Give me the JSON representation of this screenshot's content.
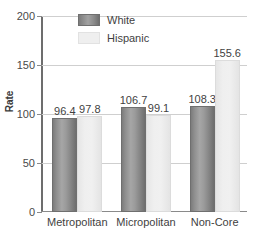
{
  "chart_data": {
    "type": "bar",
    "title": "",
    "xlabel": "",
    "ylabel": "Rate",
    "categories": [
      "Metropolitan",
      "Micropolitan",
      "Non-Core"
    ],
    "series": [
      {
        "name": "White",
        "values": [
          96.4,
          106.7,
          108.3
        ],
        "color": "#8e8e8e"
      },
      {
        "name": "Hispanic",
        "values": [
          97.8,
          99.1,
          155.6
        ],
        "color": "#efefef"
      }
    ],
    "value_labels": {
      "white": [
        "96.4",
        "106.7",
        "108.3"
      ],
      "hispanic": [
        "97.8",
        "99.1",
        "155.6"
      ]
    },
    "ylim": [
      0,
      200
    ],
    "yticks": [
      0,
      50,
      100,
      150,
      200
    ],
    "ytick_labels": [
      "0",
      "50",
      "100",
      "150",
      "200"
    ],
    "grid": true,
    "legend_position": "top-center"
  },
  "axis": {
    "y_title": "Rate"
  },
  "legend": {
    "entries": [
      {
        "label": "White"
      },
      {
        "label": "Hispanic"
      }
    ]
  }
}
